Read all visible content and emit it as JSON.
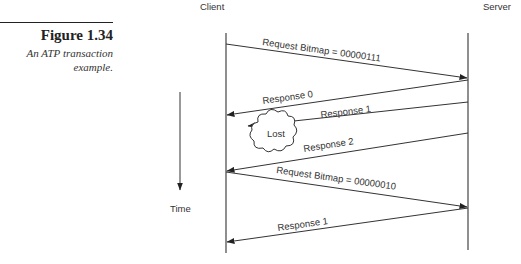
{
  "figure": {
    "number": "Figure 1.34",
    "caption": "An ATP transaction example."
  },
  "diagram": {
    "participants": {
      "client": "Client",
      "server": "Server"
    },
    "time_label": "Time",
    "lost_label": "Lost",
    "messages": [
      {
        "label": "Request Bitmap = 00000111",
        "from": "Client",
        "to": "Server"
      },
      {
        "label": "Response 0",
        "from": "Server",
        "to": "Client"
      },
      {
        "label": "Response 1",
        "from": "Server",
        "to": "Lost"
      },
      {
        "label": "Response 2",
        "from": "Server",
        "to": "Client"
      },
      {
        "label": "Request Bitmap = 00000010",
        "from": "Client",
        "to": "Server"
      },
      {
        "label": "Response 1",
        "from": "Server",
        "to": "Client"
      }
    ]
  }
}
